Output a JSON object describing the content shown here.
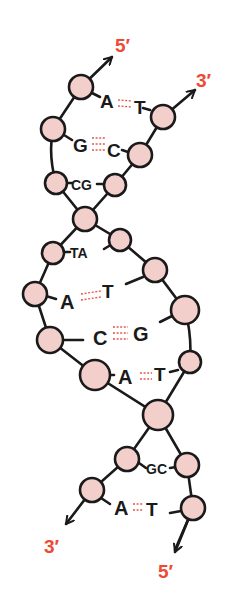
{
  "diagram": {
    "colors": {
      "node_fill": "#f3cfcc",
      "strand": "#1a1a1a",
      "end_label": "#ee4a33",
      "hydrogen_bond": "#e0584d"
    },
    "ends": {
      "top_left": "5′",
      "top_right": "3′",
      "bottom_left": "3′",
      "bottom_right": "5′"
    },
    "base_pairs": [
      {
        "left": "A",
        "right": "T",
        "bonds": 2
      },
      {
        "left": "G",
        "right": "C",
        "bonds": 3
      },
      {
        "left": "CG",
        "right": "",
        "bonds": 0
      },
      {
        "left": "TA",
        "right": "",
        "bonds": 0
      },
      {
        "left": "A",
        "right": "T",
        "bonds": 2
      },
      {
        "left": "C",
        "right": "G",
        "bonds": 3
      },
      {
        "left": "A",
        "right": "T",
        "bonds": 2
      },
      {
        "left": "GC",
        "right": "",
        "bonds": 0
      },
      {
        "left": "A",
        "right": "T",
        "bonds": 2
      }
    ]
  }
}
